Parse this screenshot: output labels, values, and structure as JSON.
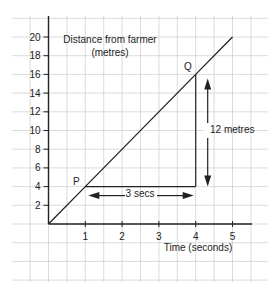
{
  "chart_data": {
    "type": "line",
    "title": "",
    "xlabel": "Time (seconds)",
    "ylabel": "Distance from farmer (metres)",
    "ylabel_line1": "Distance from farmer",
    "ylabel_line2": "(metres)",
    "xlim": [
      0,
      5.3
    ],
    "ylim": [
      0,
      22
    ],
    "x_ticks": [
      "1",
      "2",
      "3",
      "4",
      "5"
    ],
    "y_ticks": [
      "2",
      "4",
      "6",
      "8",
      "10",
      "12",
      "14",
      "16",
      "18",
      "20"
    ],
    "grid": true,
    "legend": null,
    "series": [
      {
        "name": "Distance from farmer",
        "x": [
          0,
          1,
          4,
          5
        ],
        "y": [
          0,
          4,
          16,
          20
        ]
      }
    ],
    "points": [
      {
        "label": "P",
        "x": 1,
        "y": 4
      },
      {
        "label": "Q",
        "x": 4,
        "y": 16
      }
    ],
    "annotations": {
      "horizontal": "3 secs",
      "vertical": "12 metres"
    }
  }
}
